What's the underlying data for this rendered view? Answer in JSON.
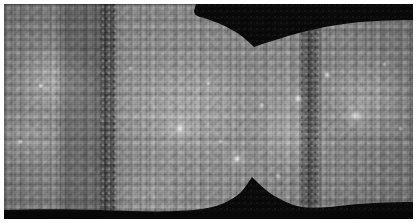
{
  "image": {
    "title": "Global photomosaic map of Mercury",
    "subject": "Mercury",
    "projection": "Simple cylindrical (equirectangular)",
    "color_mode": "Grayscale",
    "caption": ""
  },
  "canvas": {
    "width_px": 417,
    "height_px": 223,
    "margin_color": "#ffffff",
    "margin_px": 4
  },
  "palette": {
    "surface_mid_gray": "#8e8e8e",
    "surface_light_gray": "#bcbcbc",
    "surface_dark_gray": "#6a6a6a",
    "highlight_white": "#f2f2f2",
    "no_data_black": "#0a0a0a",
    "seam_shadow": "#2a2a2a"
  },
  "regions": [
    {
      "name": "no-data-top",
      "label": "Unimaged region (north)",
      "fill": "#0a0a0a",
      "left_pct": 47,
      "top_pct": 0,
      "width_pct": 53,
      "height_pct": 13
    },
    {
      "name": "no-data-bottom",
      "label": "Unimaged region (south)",
      "fill": "#0b0b0b",
      "left_pct": 0,
      "top_pct": 88,
      "width_pct": 100,
      "height_pct": 12
    },
    {
      "name": "terminator-seam-left",
      "label": "Mosaic seam / terminator",
      "fill": "#2a2a2a",
      "left_pct": 23,
      "top_pct": 0,
      "width_pct": 5,
      "height_pct": 100
    },
    {
      "name": "terminator-seam-right",
      "label": "Mosaic seam / terminator",
      "fill": "#2a2a2a",
      "left_pct": 72,
      "top_pct": 0,
      "width_pct": 6,
      "height_pct": 100
    },
    {
      "name": "dark-longitude-swath",
      "label": "Low-albedo swath",
      "fill": "#6a6a6a",
      "left_pct": 14,
      "top_pct": 0,
      "width_pct": 11,
      "height_pct": 100
    }
  ],
  "features": {
    "ray_craters_count": 19,
    "striping_artifact": "vertical scan lines",
    "seam_count": 2
  }
}
